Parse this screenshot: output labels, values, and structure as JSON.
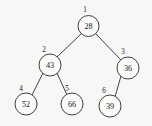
{
  "diagram": {
    "type": "binary-tree",
    "title": "",
    "background_color": "#f7f7f5",
    "stroke_color": "#2b2b2b",
    "text_color": "#191919",
    "node_radius": 10.5,
    "nodes": [
      {
        "index": "1",
        "value": "28",
        "cx": 88.5,
        "cy": 26,
        "r": 10.5,
        "index_x": 85,
        "index_y": 10
      },
      {
        "index": "2",
        "value": "43",
        "cx": 50,
        "cy": 65,
        "r": 11,
        "index_x": 44,
        "index_y": 50
      },
      {
        "index": "3",
        "value": "36",
        "cx": 128,
        "cy": 68,
        "r": 11,
        "index_x": 123,
        "index_y": 52
      },
      {
        "index": "4",
        "value": "52",
        "cx": 26,
        "cy": 104,
        "r": 11,
        "index_x": 21,
        "index_y": 89
      },
      {
        "index": "5",
        "value": "66",
        "cx": 72,
        "cy": 104,
        "r": 11,
        "index_x": 67,
        "index_y": 89
      },
      {
        "index": "6",
        "value": "39",
        "cx": 110,
        "cy": 106,
        "r": 11,
        "index_x": 104,
        "index_y": 91
      }
    ],
    "edges": [
      {
        "from": "1",
        "to": "2",
        "x1": 81,
        "y1": 34,
        "x2": 57,
        "y2": 57
      },
      {
        "from": "1",
        "to": "3",
        "x1": 96,
        "y1": 34,
        "x2": 121,
        "y2": 60
      },
      {
        "from": "2",
        "to": "4",
        "x1": 43,
        "y1": 73,
        "x2": 32,
        "y2": 95
      },
      {
        "from": "2",
        "to": "5",
        "x1": 57,
        "y1": 73,
        "x2": 67,
        "y2": 95
      },
      {
        "from": "3",
        "to": "6",
        "x1": 121,
        "y1": 76,
        "x2": 115,
        "y2": 97
      }
    ]
  }
}
